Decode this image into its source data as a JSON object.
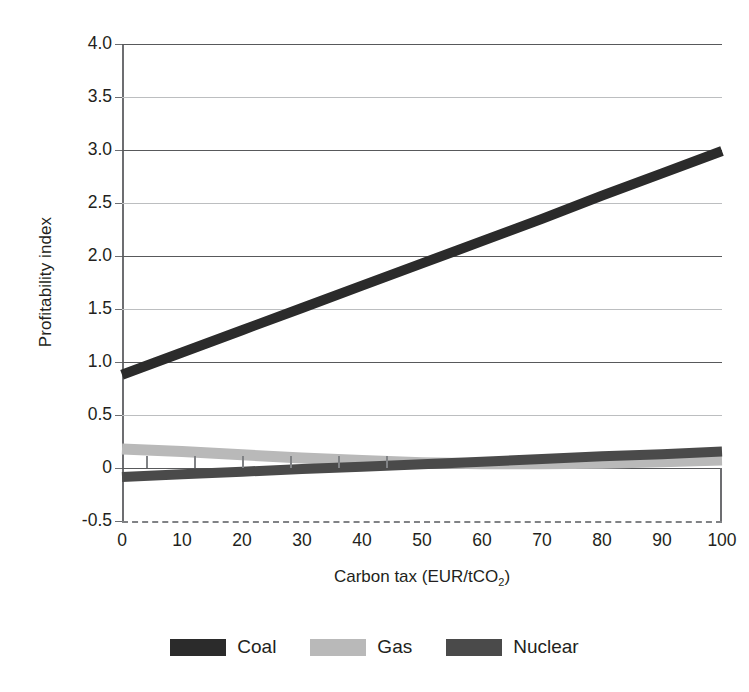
{
  "chart_data": {
    "type": "line",
    "title": "",
    "xlabel": "Carbon tax (EUR/tCO2)",
    "xlabel_prefix": "Carbon tax (EUR/tCO",
    "xlabel_sub": "2",
    "xlabel_suffix": ")",
    "ylabel": "Profitability index",
    "xlim": [
      0,
      100
    ],
    "ylim": [
      -0.5,
      4.0
    ],
    "grid": true,
    "legend_position": "bottom",
    "xticks": [
      0,
      10,
      20,
      30,
      40,
      50,
      60,
      70,
      80,
      90,
      100
    ],
    "xtick_labels": [
      "0",
      "10",
      "20",
      "30",
      "40",
      "50",
      "60",
      "70",
      "80",
      "90",
      "100"
    ],
    "yticks": [
      -0.5,
      0,
      0.5,
      1.0,
      1.5,
      2.0,
      2.5,
      3.0,
      3.5,
      4.0
    ],
    "ytick_labels": [
      "-0.5",
      "0",
      "0.5",
      "1.0",
      "1.5",
      "2.0",
      "2.5",
      "3.0",
      "3.5",
      "4.0"
    ],
    "ygrid_major": [
      0,
      1.0,
      2.0,
      3.0,
      4.0
    ],
    "ygrid_minor": [
      0.5,
      1.5,
      2.5,
      3.5
    ],
    "ygrid_dashed": [
      -0.5
    ],
    "x": [
      0,
      10,
      20,
      30,
      40,
      50,
      60,
      70,
      80,
      90,
      100
    ],
    "series": [
      {
        "name": "Coal",
        "color": "#2b2b2b",
        "values": [
          0.88,
          1.09,
          1.3,
          1.51,
          1.72,
          1.93,
          2.14,
          2.35,
          2.57,
          2.78,
          2.99
        ]
      },
      {
        "name": "Gas",
        "color": "#b9b9b9",
        "values": [
          0.18,
          0.155,
          0.125,
          0.095,
          0.07,
          0.05,
          0.04,
          0.04,
          0.045,
          0.06,
          0.075
        ]
      },
      {
        "name": "Nuclear",
        "color": "#4a4a4a",
        "values": [
          -0.085,
          -0.06,
          -0.035,
          -0.01,
          0.012,
          0.035,
          0.06,
          0.085,
          0.11,
          0.13,
          0.155
        ]
      }
    ]
  },
  "legend": {
    "items": [
      {
        "label": "Coal",
        "color": "#2b2b2b"
      },
      {
        "label": "Gas",
        "color": "#b9b9b9"
      },
      {
        "label": "Nuclear",
        "color": "#4a4a4a"
      }
    ]
  },
  "colors": {
    "background": "#ffffff",
    "text": "#231f20",
    "gridline_major": "#58595b",
    "gridline_minor": "#bcbec0",
    "gridline_dashed": "#808285",
    "axis": "#6d6e71"
  }
}
